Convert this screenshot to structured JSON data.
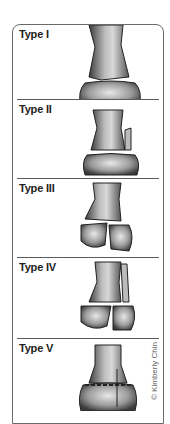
{
  "figure": {
    "panels": [
      {
        "label": "Type I"
      },
      {
        "label": "Type II"
      },
      {
        "label": "Type III"
      },
      {
        "label": "Type IV"
      },
      {
        "label": "Type V"
      }
    ],
    "credit": "© Kimberly Chin"
  }
}
